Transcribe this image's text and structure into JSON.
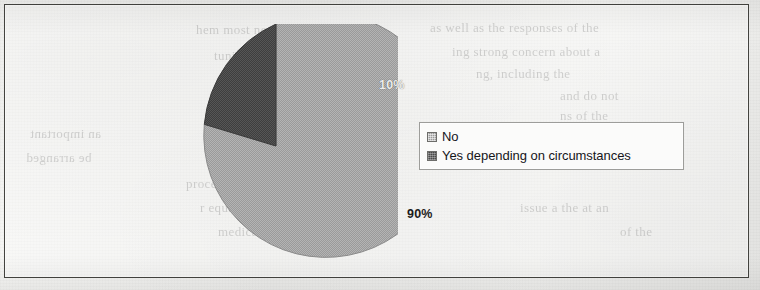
{
  "figure": {
    "frame_color": "#43433f",
    "page_background": "#f2f2f0"
  },
  "pie": {
    "minor_label": "10%",
    "major_label": "90%",
    "center_x": 275,
    "center_y": 145,
    "radius": 122
  },
  "legend": {
    "items": [
      {
        "label": "No",
        "swatch": "light-gray-pattern-swatch",
        "color": "#9a9a9a"
      },
      {
        "label": "Yes depending on circumstances",
        "swatch": "dark-gray-pattern-swatch",
        "color": "#4a4a4a"
      }
    ]
  },
  "bleed_through": {
    "lines": [
      {
        "text": "hem most notice considerable",
        "x": 196,
        "y": 22,
        "size": 13,
        "mirror": false
      },
      {
        "text": "tunica  test  women",
        "x": 214,
        "y": 48,
        "size": 13,
        "mirror": false
      },
      {
        "text": "mportant  social  service",
        "x": 230,
        "y": 70,
        "size": 13,
        "mirror": false
      },
      {
        "text": "the ends, interviewing",
        "x": 210,
        "y": 92,
        "size": 13,
        "mirror": false
      },
      {
        "text": "as well as the responses of the",
        "x": 430,
        "y": 20,
        "size": 13,
        "mirror": false
      },
      {
        "text": "ing strong concern about a",
        "x": 452,
        "y": 44,
        "size": 13,
        "mirror": false
      },
      {
        "text": "ng, including the",
        "x": 476,
        "y": 66,
        "size": 13,
        "mirror": false
      },
      {
        "text": "and do not",
        "x": 560,
        "y": 88,
        "size": 13,
        "mirror": false
      },
      {
        "text": "ns of the",
        "x": 560,
        "y": 108,
        "size": 13,
        "mirror": false
      },
      {
        "text": "processing of the",
        "x": 186,
        "y": 176,
        "size": 13,
        "mirror": false
      },
      {
        "text": "r equally measured",
        "x": 200,
        "y": 200,
        "size": 13,
        "mirror": false
      },
      {
        "text": "medical management before",
        "x": 218,
        "y": 224,
        "size": 13,
        "mirror": false
      },
      {
        "text": "issue a  the at an",
        "x": 520,
        "y": 200,
        "size": 13,
        "mirror": false
      },
      {
        "text": "of the",
        "x": 620,
        "y": 224,
        "size": 13,
        "mirror": false
      },
      {
        "text": "an important",
        "x": 30,
        "y": 126,
        "size": 13,
        "mirror": true
      },
      {
        "text": "be arranged",
        "x": 26,
        "y": 150,
        "size": 13,
        "mirror": true
      }
    ]
  },
  "chart_data": {
    "type": "pie",
    "title": "",
    "categories": [
      "No",
      "Yes depending on circumstances"
    ],
    "values": [
      90,
      10
    ],
    "value_labels": [
      "90%",
      "10%"
    ],
    "colors": [
      "#9a9a9a",
      "#4a4a4a"
    ],
    "units": "percent",
    "legend_position": "right",
    "start_angle_deg": 0,
    "direction": "clockwise",
    "grid": false,
    "xlabel": "",
    "ylabel": ""
  }
}
